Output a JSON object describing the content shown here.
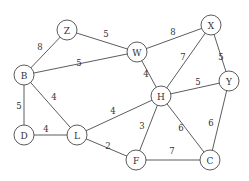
{
  "diagram": {
    "type": "weighted-undirected-graph",
    "node_radius": 10,
    "nodes": [
      {
        "id": "Z",
        "label": "Z",
        "x": 67,
        "y": 30
      },
      {
        "id": "W",
        "label": "W",
        "x": 137,
        "y": 52
      },
      {
        "id": "X",
        "label": "X",
        "x": 211,
        "y": 25
      },
      {
        "id": "B",
        "label": "B",
        "x": 24,
        "y": 75
      },
      {
        "id": "H",
        "label": "H",
        "x": 161,
        "y": 96
      },
      {
        "id": "Y",
        "label": "Y",
        "x": 229,
        "y": 81
      },
      {
        "id": "D",
        "label": "D",
        "x": 24,
        "y": 135
      },
      {
        "id": "L",
        "label": "L",
        "x": 77,
        "y": 135
      },
      {
        "id": "F",
        "label": "F",
        "x": 136,
        "y": 160
      },
      {
        "id": "C",
        "label": "C",
        "x": 210,
        "y": 160
      }
    ],
    "edges": [
      {
        "from": "Z",
        "to": "W",
        "weight": "5",
        "lx": 106,
        "ly": 34
      },
      {
        "from": "Z",
        "to": "B",
        "weight": "8",
        "lx": 40,
        "ly": 47
      },
      {
        "from": "W",
        "to": "X",
        "weight": "8",
        "lx": 173,
        "ly": 32
      },
      {
        "from": "B",
        "to": "W",
        "weight": "5",
        "lx": 79,
        "ly": 63
      },
      {
        "from": "W",
        "to": "H",
        "weight": "4",
        "lx": 146,
        "ly": 74
      },
      {
        "from": "X",
        "to": "H",
        "weight": "7",
        "lx": 183,
        "ly": 57
      },
      {
        "from": "X",
        "to": "Y",
        "weight": "5",
        "lx": 221,
        "ly": 57
      },
      {
        "from": "H",
        "to": "Y",
        "weight": "5",
        "lx": 198,
        "ly": 82
      },
      {
        "from": "B",
        "to": "D",
        "weight": "5",
        "lx": 19,
        "ly": 106
      },
      {
        "from": "B",
        "to": "L",
        "weight": "4",
        "lx": 54,
        "ly": 97
      },
      {
        "from": "D",
        "to": "L",
        "weight": "4",
        "lx": 46,
        "ly": 129
      },
      {
        "from": "L",
        "to": "H",
        "weight": "4",
        "lx": 113,
        "ly": 111
      },
      {
        "from": "L",
        "to": "F",
        "weight": "2",
        "lx": 108,
        "ly": 146
      },
      {
        "from": "H",
        "to": "F",
        "weight": "3",
        "lx": 142,
        "ly": 126
      },
      {
        "from": "H",
        "to": "C",
        "weight": "6",
        "lx": 181,
        "ly": 128
      },
      {
        "from": "Y",
        "to": "C",
        "weight": "6",
        "lx": 211,
        "ly": 123
      },
      {
        "from": "F",
        "to": "C",
        "weight": "7",
        "lx": 172,
        "ly": 151
      }
    ]
  }
}
